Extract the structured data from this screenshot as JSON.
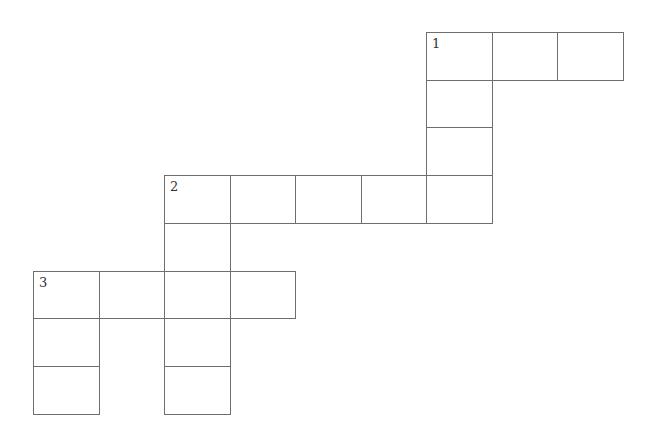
{
  "puzzle": {
    "type": "crossword",
    "cell_width": 65.5,
    "cell_height": 47.7,
    "origin_x": 33,
    "origin_y": 32,
    "cells": [
      {
        "col": 6,
        "row": 0,
        "number": "1"
      },
      {
        "col": 7,
        "row": 0,
        "number": ""
      },
      {
        "col": 8,
        "row": 0,
        "number": ""
      },
      {
        "col": 6,
        "row": 1,
        "number": ""
      },
      {
        "col": 6,
        "row": 2,
        "number": ""
      },
      {
        "col": 2,
        "row": 3,
        "number": "2"
      },
      {
        "col": 3,
        "row": 3,
        "number": ""
      },
      {
        "col": 4,
        "row": 3,
        "number": ""
      },
      {
        "col": 5,
        "row": 3,
        "number": ""
      },
      {
        "col": 6,
        "row": 3,
        "number": ""
      },
      {
        "col": 2,
        "row": 4,
        "number": ""
      },
      {
        "col": 0,
        "row": 5,
        "number": "3"
      },
      {
        "col": 1,
        "row": 5,
        "number": ""
      },
      {
        "col": 2,
        "row": 5,
        "number": ""
      },
      {
        "col": 3,
        "row": 5,
        "number": ""
      },
      {
        "col": 0,
        "row": 6,
        "number": ""
      },
      {
        "col": 2,
        "row": 6,
        "number": ""
      },
      {
        "col": 0,
        "row": 7,
        "number": ""
      },
      {
        "col": 2,
        "row": 7,
        "number": ""
      }
    ],
    "clue_numbers": [
      "1",
      "2",
      "3"
    ]
  }
}
